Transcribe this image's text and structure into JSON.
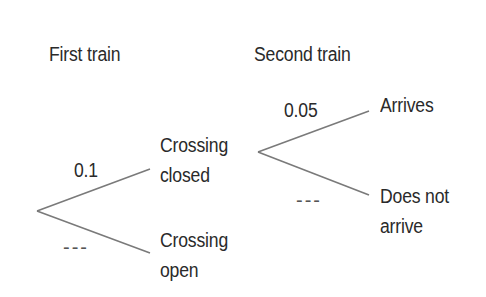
{
  "diagram": {
    "type": "probability-tree",
    "headers": {
      "first_stage": "First train",
      "second_stage": "Second train"
    },
    "stage1": {
      "branches": [
        {
          "outcome_line1": "Crossing",
          "outcome_line2": "closed",
          "probability": "0.1"
        },
        {
          "outcome_line1": "Crossing",
          "outcome_line2": "open",
          "probability": "---"
        }
      ]
    },
    "stage2": {
      "parent": "Crossing closed",
      "branches": [
        {
          "outcome_line1": "Arrives",
          "outcome_line2": "",
          "probability": "0.05"
        },
        {
          "outcome_line1": "Does not",
          "outcome_line2": "arrive",
          "probability": "---"
        }
      ]
    },
    "line_color": "#7a7a7a",
    "text_color": "#2a2a2a"
  }
}
